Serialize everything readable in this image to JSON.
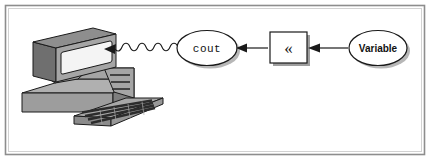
{
  "figure": {
    "background_color": "#ffffff",
    "border_color": "#8a8a8a",
    "border_inner_color": "#c9c9c9"
  },
  "nodes": {
    "computer": {
      "name": "computer",
      "label": "",
      "monitor_face_color": "#a8a8a8",
      "monitor_side_color": "#6e6e6e",
      "monitor_top_color": "#8f8f8f",
      "screen_color": "#f2f2f2",
      "case_color": "#a8a8a8",
      "case_side_color": "#7c7c7c",
      "keyboard_color": "#a3a3a3",
      "key_color": "#2f2f2f",
      "outline_color": "#1a1a1a"
    },
    "cout": {
      "name": "cout-node",
      "label": "cout",
      "shape": "ellipse",
      "fill": "#ffffff",
      "stroke": "#1a1a1a",
      "shadow": "#b5b5b5"
    },
    "operator": {
      "name": "insertion-operator-node",
      "label": "«",
      "label_text": "<<",
      "shape": "rectangle",
      "fill": "#ffffff",
      "stroke": "#1a1a1a",
      "shadow": "#9e9e9e"
    },
    "variable": {
      "name": "variable-node",
      "label": "Variable",
      "shape": "ellipse",
      "fill": "#ffffff",
      "stroke": "#1a1a1a",
      "shadow": "#b5b5b5"
    }
  },
  "connectors": [
    {
      "name": "wavy-output-connector",
      "from": "cout",
      "to": "computer",
      "style": "wavy",
      "arrow": "left",
      "color": "#1a1a1a"
    },
    {
      "name": "operator-to-cout-connector",
      "from": "operator",
      "to": "cout",
      "style": "straight",
      "arrow": "left",
      "color": "#1a1a1a"
    },
    {
      "name": "variable-to-operator-connector",
      "from": "variable",
      "to": "operator",
      "style": "straight",
      "arrow": "left",
      "color": "#1a1a1a"
    }
  ]
}
